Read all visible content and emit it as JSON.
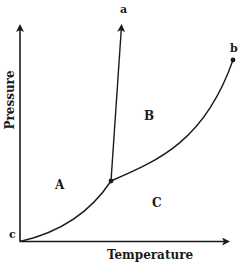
{
  "diagram": {
    "type": "phase-diagram",
    "axes": {
      "x_label": "Temperature",
      "y_label": "Pressure"
    },
    "regions": [
      {
        "id": "A",
        "label": "A"
      },
      {
        "id": "B",
        "label": "B"
      },
      {
        "id": "C",
        "label": "C"
      }
    ],
    "points": [
      {
        "id": "a",
        "label": "a",
        "description": "end of near-vertical boundary line (arrow)"
      },
      {
        "id": "b",
        "label": "b",
        "description": "endpoint of curved boundary (dot)"
      },
      {
        "id": "c",
        "label": "c",
        "description": "origin of lower curve"
      }
    ],
    "boundaries": [
      {
        "name": "line c to triple point",
        "from": "c",
        "to": "triple-point"
      },
      {
        "name": "line triple point to a",
        "from": "triple-point",
        "to": "a"
      },
      {
        "name": "curve triple point to b",
        "from": "triple-point",
        "to": "b"
      }
    ],
    "colors": {
      "ink": "#1a1a1a",
      "background": "#ffffff"
    }
  }
}
